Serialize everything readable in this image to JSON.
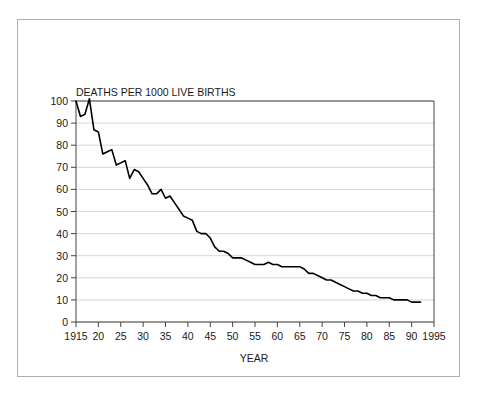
{
  "chart_data": {
    "type": "line",
    "title": "DEATHS PER 1000 LIVE BIRTHS",
    "xlabel": "YEAR",
    "ylabel": "",
    "xlim": [
      1915,
      1995
    ],
    "ylim": [
      0,
      100
    ],
    "grid": true,
    "legend": "none",
    "xticks": [
      1915,
      1920,
      1925,
      1930,
      1935,
      1940,
      1945,
      1950,
      1955,
      1960,
      1965,
      1970,
      1975,
      1980,
      1985,
      1990,
      1995
    ],
    "xticklabels": [
      "1915",
      "20",
      "25",
      "30",
      "35",
      "40",
      "45",
      "50",
      "55",
      "60",
      "65",
      "70",
      "75",
      "80",
      "85",
      "90",
      "1995"
    ],
    "yticks": [
      0,
      10,
      20,
      30,
      40,
      50,
      60,
      70,
      80,
      90,
      100
    ],
    "yticklabels": [
      "0",
      "10",
      "20",
      "30",
      "40",
      "50",
      "60",
      "70",
      "80",
      "90",
      "100"
    ],
    "line_color": "#000000",
    "grid_color": "#cccccc",
    "axis_color": "#555555",
    "x": [
      1915,
      1916,
      1917,
      1918,
      1919,
      1920,
      1921,
      1922,
      1923,
      1924,
      1925,
      1926,
      1927,
      1928,
      1929,
      1930,
      1931,
      1932,
      1933,
      1934,
      1935,
      1936,
      1937,
      1938,
      1939,
      1940,
      1941,
      1942,
      1943,
      1944,
      1945,
      1946,
      1947,
      1948,
      1949,
      1950,
      1951,
      1952,
      1953,
      1954,
      1955,
      1956,
      1957,
      1958,
      1959,
      1960,
      1961,
      1962,
      1963,
      1964,
      1965,
      1966,
      1967,
      1968,
      1969,
      1970,
      1971,
      1972,
      1973,
      1974,
      1975,
      1976,
      1977,
      1978,
      1979,
      1980,
      1981,
      1982,
      1983,
      1984,
      1985,
      1986,
      1987,
      1988,
      1989,
      1990,
      1991,
      1992
    ],
    "values": [
      100,
      93,
      94,
      101,
      87,
      86,
      76,
      77,
      78,
      71,
      72,
      73,
      65,
      69,
      68,
      65,
      62,
      58,
      58,
      60,
      56,
      57,
      54,
      51,
      48,
      47,
      46,
      41,
      40,
      40,
      38,
      34,
      32,
      32,
      31,
      29,
      29,
      29,
      28,
      27,
      26,
      26,
      26,
      27,
      26,
      26,
      25,
      25,
      25,
      25,
      25,
      24,
      22,
      22,
      21,
      20,
      19,
      19,
      18,
      17,
      16,
      15,
      14,
      14,
      13,
      13,
      12,
      12,
      11,
      11,
      11,
      10,
      10,
      10,
      10,
      9,
      9,
      9
    ],
    "annotations": []
  }
}
